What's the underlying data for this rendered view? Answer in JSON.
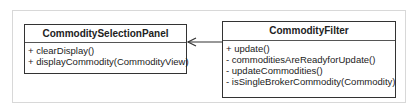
{
  "diagram": {
    "type": "uml-class",
    "classes": [
      {
        "name": "CommoditySelectionPanel",
        "operations": [
          "+ clearDisplay()",
          "+ displayCommodity(CommodityView)"
        ]
      },
      {
        "name": "CommodityFilter",
        "operations": [
          "+ update()",
          "- commoditiesAreReadyforUpdate()",
          "- updateCommodities()",
          "- isSingleBrokerCommodity(Commodity)"
        ]
      }
    ],
    "relations": [
      {
        "from": "CommodityFilter",
        "to": "CommoditySelectionPanel",
        "kind": "navigable-association"
      }
    ],
    "colors": {
      "line": "#333333",
      "frame": "#d8d8d8",
      "background": "#ffffff"
    }
  }
}
